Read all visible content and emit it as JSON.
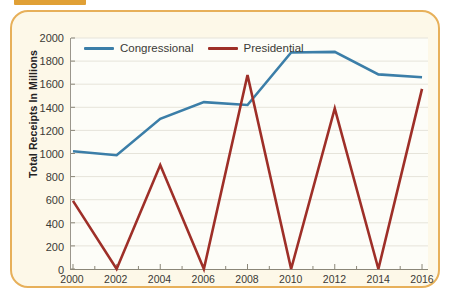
{
  "page": {
    "top_bar_fragment_text": "a, pig     i, a, pa, a",
    "card_background": "#fdf8e8",
    "card_border_color": "#e7b05a",
    "plot_background": "#fdfdf8",
    "gridline_color": "#e6e4da",
    "axis_color": "#8a8678"
  },
  "chart_data": {
    "type": "line",
    "title": "",
    "xlabel": "",
    "ylabel": "Total Receipts In Millions",
    "x": [
      2000,
      2002,
      2004,
      2006,
      2008,
      2010,
      2012,
      2014,
      2016
    ],
    "xticklabels": [
      "2000",
      "2002",
      "2004",
      "2006",
      "2008",
      "2010",
      "2012",
      "2014",
      "2016"
    ],
    "xlim": [
      2000,
      2016
    ],
    "ylim": [
      0,
      2000
    ],
    "yticks": [
      0,
      200,
      400,
      600,
      800,
      1000,
      1200,
      1400,
      1600,
      1800,
      2000
    ],
    "yticklabels": [
      "0",
      "200",
      "400",
      "600",
      "800",
      "1000",
      "1200",
      "1400",
      "1600",
      "1800",
      "2000"
    ],
    "grid": "horizontal",
    "legend_position": "top-left inside",
    "series": [
      {
        "name": "Congressional",
        "color": "#3b7ea8",
        "values": [
          1020,
          985,
          1300,
          1445,
          1420,
          1875,
          1880,
          1685,
          1660
        ]
      },
      {
        "name": "Presidential",
        "color": "#9e2f28",
        "values": [
          590,
          0,
          900,
          0,
          1680,
          0,
          1390,
          0,
          1560
        ]
      }
    ]
  }
}
